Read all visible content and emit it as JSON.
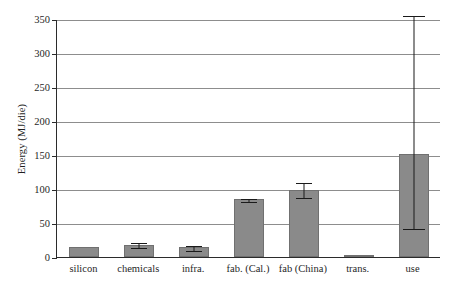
{
  "chart_data": {
    "type": "bar",
    "title": "",
    "xlabel": "",
    "ylabel": "Energy (MJ/die)",
    "ylim": [
      0,
      350
    ],
    "ytick_step": 50,
    "yticks": [
      0,
      50,
      100,
      150,
      200,
      250,
      300,
      350
    ],
    "ytick_labels": [
      "0",
      "50",
      "100",
      "150",
      "200",
      "250",
      "300",
      "350"
    ],
    "grid": "horizontal",
    "legend": "none",
    "bar_color": "#8a8a8a",
    "axis_color": "#2b2b2b",
    "gridline_color": "#8d8d8d",
    "categories": [
      "silicon",
      "chemicals",
      "infra.",
      "fab. (Cal.)",
      "fab (China)",
      "trans.",
      "use"
    ],
    "values": [
      14,
      18,
      14,
      85,
      99,
      1,
      151
    ],
    "error_low": [
      14,
      14,
      11,
      83,
      88,
      1,
      42
    ],
    "error_high": [
      14,
      22,
      17,
      87,
      110,
      1,
      356
    ],
    "has_error_bar": [
      false,
      true,
      true,
      true,
      true,
      false,
      true
    ],
    "series": [
      {
        "name": "Energy per die",
        "values": [
          14,
          18,
          14,
          85,
          99,
          1,
          151
        ]
      }
    ]
  }
}
